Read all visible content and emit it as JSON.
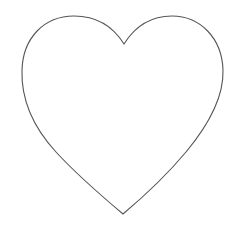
{
  "drawing": {
    "subject": "heart-outline",
    "stroke_color": "#555555",
    "background_color": "#ffffff",
    "stroke_width": 1.1
  }
}
